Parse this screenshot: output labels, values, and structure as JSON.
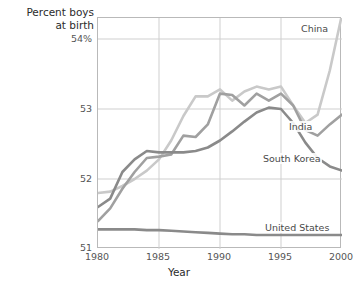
{
  "chart_data": {
    "type": "line",
    "title": "",
    "ylabel": "Percent boys at birth",
    "xlabel": "Year",
    "xlim": [
      1980,
      2000
    ],
    "ylim": [
      51,
      54.3
    ],
    "x_ticks": [
      "1980",
      "1985",
      "1990",
      "1995",
      "2000"
    ],
    "x_tick_values": [
      1980,
      1985,
      1990,
      1995,
      2000
    ],
    "y_ticks": [
      "51",
      "52",
      "53",
      "54%"
    ],
    "y_tick_values": [
      51,
      52,
      53,
      54
    ],
    "grid": "both",
    "legend": "inline-labels",
    "x": [
      1980,
      1981,
      1982,
      1983,
      1984,
      1985,
      1986,
      1987,
      1988,
      1989,
      1990,
      1991,
      1992,
      1993,
      1994,
      1995,
      1996,
      1997,
      1998,
      1999,
      2000
    ],
    "series": [
      {
        "name": "China",
        "color": "#c9c9c9",
        "label_position": "top-right",
        "values": [
          51.8,
          51.82,
          51.9,
          52.0,
          52.12,
          52.28,
          52.55,
          52.9,
          53.18,
          53.18,
          53.28,
          53.12,
          53.25,
          53.32,
          53.28,
          53.32,
          53.05,
          52.8,
          52.92,
          53.55,
          54.35
        ]
      },
      {
        "name": "India",
        "color": "#a0a0a0",
        "label_position": "right-middle",
        "values": [
          51.4,
          51.58,
          51.86,
          52.1,
          52.3,
          52.32,
          52.35,
          52.62,
          52.6,
          52.78,
          53.22,
          53.2,
          53.05,
          53.22,
          53.12,
          53.22,
          53.05,
          52.7,
          52.62,
          52.78,
          52.92
        ]
      },
      {
        "name": "South Korea",
        "color": "#8a8a8a",
        "label_position": "right-lower",
        "values": [
          51.6,
          51.72,
          52.1,
          52.28,
          52.4,
          52.38,
          52.38,
          52.38,
          52.4,
          52.45,
          52.55,
          52.68,
          52.82,
          52.95,
          53.02,
          53.0,
          52.8,
          52.52,
          52.3,
          52.18,
          52.12
        ]
      },
      {
        "name": "United States",
        "color": "#8a8a8a",
        "label_position": "right-bottom",
        "values": [
          51.28,
          51.28,
          51.28,
          51.28,
          51.27,
          51.27,
          51.26,
          51.25,
          51.24,
          51.23,
          51.22,
          51.21,
          51.21,
          51.2,
          51.2,
          51.2,
          51.2,
          51.2,
          51.2,
          51.2,
          51.2
        ]
      }
    ]
  },
  "axes": {
    "y_title_line1": "Percent boys",
    "y_title_line2": "at birth",
    "x_title": "Year",
    "y_labels": [
      "54%",
      "53",
      "52",
      "51"
    ],
    "x_labels": [
      "1980",
      "1985",
      "1990",
      "1995",
      "2000"
    ]
  },
  "series_labels": {
    "china": "China",
    "india": "India",
    "south_korea": "South Korea",
    "united_states": "United States"
  }
}
